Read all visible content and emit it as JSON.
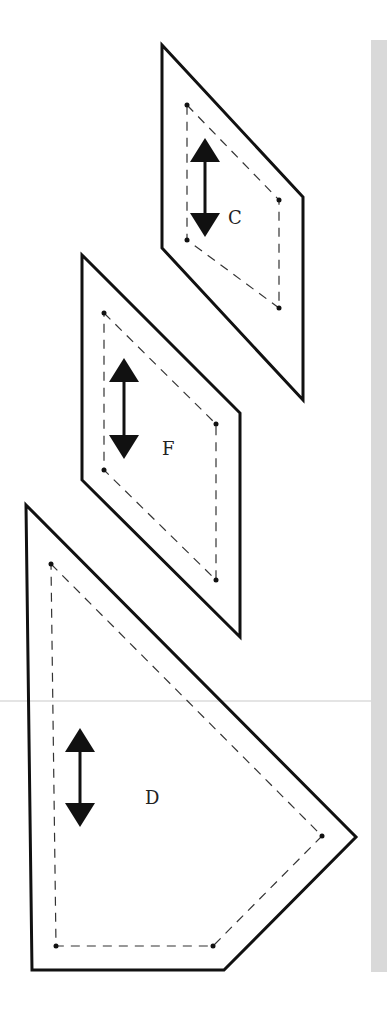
{
  "diagram": {
    "type": "sewing-pattern-pieces",
    "colors": {
      "outline": "#111111",
      "seam": "#333333",
      "strip": "#d9d9d9",
      "background": "#ffffff"
    },
    "pieces": [
      {
        "label": "C",
        "grainline": "vertical-double-arrow"
      },
      {
        "label": "F",
        "grainline": "vertical-double-arrow"
      },
      {
        "label": "D",
        "grainline": "vertical-double-arrow"
      }
    ]
  }
}
